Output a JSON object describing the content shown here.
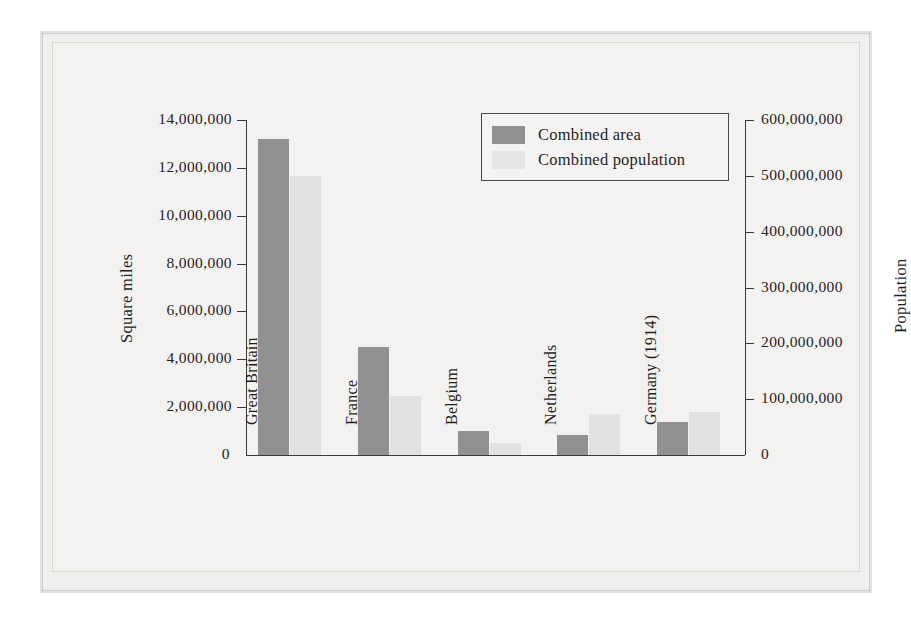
{
  "figure": {
    "legend": {
      "items": [
        {
          "label": "Combined area",
          "color": "#919191",
          "icon": "legend-swatch-icon"
        },
        {
          "label": "Combined population",
          "color": "#e6e5e3",
          "icon": "legend-swatch-icon"
        }
      ]
    },
    "left_axis_title": "Square miles",
    "right_axis_title": "Population"
  },
  "chart_data": {
    "type": "bar",
    "title": "",
    "subtitle": "",
    "categories": [
      "Great Britain",
      "France",
      "Belgium",
      "Netherlands",
      "Germany (1914)"
    ],
    "series": [
      {
        "name": "Combined area",
        "axis": "left",
        "unit": "square miles",
        "color": "#919191",
        "values": [
          13200000,
          4500000,
          1000000,
          850000,
          1400000
        ]
      },
      {
        "name": "Combined population",
        "axis": "right",
        "unit": "population",
        "color": "#e2e1df",
        "values": [
          500000000,
          105000000,
          22000000,
          74000000,
          77000000
        ]
      }
    ],
    "xlabel": "",
    "ylabel": "Square miles",
    "y2label": "Population",
    "ylim": [
      0,
      14000000
    ],
    "y2lim": [
      0,
      600000000
    ],
    "ytick_labels": [
      "14,000,000",
      "12,000,000",
      "10,000,000",
      "8,000,000",
      "6,000,000",
      "4,000,000",
      "2,000,000",
      "0"
    ],
    "ytick_values": [
      14000000,
      12000000,
      10000000,
      8000000,
      6000000,
      4000000,
      2000000,
      0
    ],
    "y2tick_labels": [
      "600,000,000",
      "500,000,000",
      "400,000,000",
      "300,000,000",
      "200,000,000",
      "100,000,000",
      "0"
    ],
    "y2tick_values": [
      600000000,
      500000000,
      400000000,
      300000000,
      200000000,
      100000000,
      0
    ],
    "grid": false,
    "legend_position": "top-center"
  }
}
